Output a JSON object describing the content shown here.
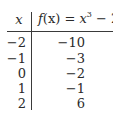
{
  "table": {
    "header": {
      "x_label": "x",
      "f_label_prefix": "f",
      "f_label_arg": "(x) = ",
      "f_label_var": "x",
      "f_label_exp": "3",
      "f_label_suffix": " − 2"
    },
    "rows": [
      {
        "x": "−2",
        "f": "−10"
      },
      {
        "x": "−1",
        "f": "−3"
      },
      {
        "x": "0",
        "f": "−2"
      },
      {
        "x": "1",
        "f": "−1"
      },
      {
        "x": "2",
        "f": "6"
      }
    ]
  }
}
